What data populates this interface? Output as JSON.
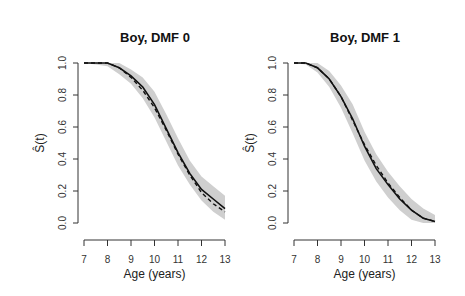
{
  "chart_data": [
    {
      "type": "line",
      "title": "Boy, DMF 0",
      "xlabel": "Age (years)",
      "ylabel": "Ŝ(t)",
      "xlim": [
        7,
        13
      ],
      "ylim": [
        0,
        1
      ],
      "x_ticks": [
        "7",
        "8",
        "9",
        "10",
        "11",
        "12",
        "13"
      ],
      "y_ticks": [
        "0.0",
        "0.2",
        "0.4",
        "0.6",
        "0.8",
        "1.0"
      ],
      "grid": false,
      "legend": "none",
      "series": [
        {
          "name": "estimate (solid)",
          "style": "solid",
          "x": [
            7,
            7.5,
            8,
            8.5,
            9,
            9.5,
            10,
            10.5,
            11,
            11.5,
            12,
            12.5,
            13
          ],
          "y": [
            1.0,
            1.0,
            1.0,
            0.97,
            0.92,
            0.85,
            0.74,
            0.59,
            0.44,
            0.31,
            0.21,
            0.15,
            0.09
          ]
        },
        {
          "name": "comparison (dashed)",
          "style": "dashed",
          "x": [
            7,
            7.5,
            8,
            8.5,
            9,
            9.5,
            10,
            10.5,
            11,
            11.5,
            12,
            12.5,
            13
          ],
          "y": [
            1.0,
            1.0,
            1.0,
            0.97,
            0.91,
            0.83,
            0.72,
            0.58,
            0.43,
            0.3,
            0.19,
            0.12,
            0.07
          ]
        },
        {
          "name": "confidence band lower",
          "style": "band",
          "x": [
            7,
            7.5,
            8,
            8.5,
            9,
            9.5,
            10,
            10.5,
            11,
            11.5,
            12,
            12.5,
            13
          ],
          "y": [
            1.0,
            0.99,
            0.98,
            0.93,
            0.87,
            0.78,
            0.66,
            0.51,
            0.36,
            0.24,
            0.14,
            0.07,
            0.02
          ]
        },
        {
          "name": "confidence band upper",
          "style": "band",
          "x": [
            7,
            7.5,
            8,
            8.5,
            9,
            9.5,
            10,
            10.5,
            11,
            11.5,
            12,
            12.5,
            13
          ],
          "y": [
            1.0,
            1.0,
            1.0,
            1.0,
            0.96,
            0.91,
            0.82,
            0.68,
            0.53,
            0.39,
            0.29,
            0.23,
            0.17
          ]
        }
      ]
    },
    {
      "type": "line",
      "title": "Boy, DMF 1",
      "xlabel": "Age (years)",
      "ylabel": "Ŝ(t)",
      "xlim": [
        7,
        13
      ],
      "ylim": [
        0,
        1
      ],
      "x_ticks": [
        "7",
        "8",
        "9",
        "10",
        "11",
        "12",
        "13"
      ],
      "y_ticks": [
        "0.0",
        "0.2",
        "0.4",
        "0.6",
        "0.8",
        "1.0"
      ],
      "grid": false,
      "legend": "none",
      "series": [
        {
          "name": "estimate (solid)",
          "style": "solid",
          "x": [
            7,
            7.5,
            8,
            8.5,
            9,
            9.5,
            10,
            10.5,
            11,
            11.5,
            12,
            12.5,
            13
          ],
          "y": [
            1.0,
            1.0,
            0.97,
            0.9,
            0.79,
            0.65,
            0.48,
            0.34,
            0.24,
            0.15,
            0.08,
            0.03,
            0.01
          ]
        },
        {
          "name": "comparison (dashed)",
          "style": "dashed",
          "x": [
            7,
            7.5,
            8,
            8.5,
            9,
            9.5,
            10,
            10.5,
            11,
            11.5,
            12,
            12.5,
            13
          ],
          "y": [
            1.0,
            1.0,
            0.97,
            0.9,
            0.79,
            0.64,
            0.49,
            0.36,
            0.25,
            0.16,
            0.08,
            0.03,
            0.01
          ]
        },
        {
          "name": "confidence band lower",
          "style": "band",
          "x": [
            7,
            7.5,
            8,
            8.5,
            9,
            9.5,
            10,
            10.5,
            11,
            11.5,
            12,
            12.5,
            13
          ],
          "y": [
            1.0,
            0.99,
            0.94,
            0.85,
            0.72,
            0.56,
            0.39,
            0.26,
            0.16,
            0.08,
            0.02,
            0.0,
            0.0
          ]
        },
        {
          "name": "confidence band upper",
          "style": "band",
          "x": [
            7,
            7.5,
            8,
            8.5,
            9,
            9.5,
            10,
            10.5,
            11,
            11.5,
            12,
            12.5,
            13
          ],
          "y": [
            1.0,
            1.0,
            1.0,
            0.95,
            0.86,
            0.74,
            0.57,
            0.43,
            0.32,
            0.23,
            0.15,
            0.09,
            0.05
          ]
        }
      ]
    }
  ],
  "colors": {
    "band": "#cfcfcf",
    "line": "#111111",
    "axis": "#333333"
  }
}
